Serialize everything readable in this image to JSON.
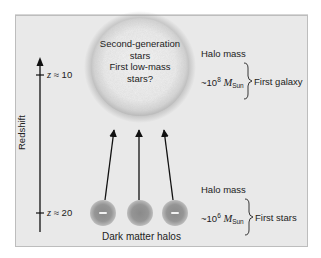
{
  "diagram": {
    "axis": {
      "label": "Redshift",
      "ticks": [
        {
          "symbol": "z",
          "approx": "≈",
          "value": "10"
        },
        {
          "symbol": "z",
          "approx": "≈",
          "value": "20"
        }
      ]
    },
    "sphere": {
      "lines": [
        "Second-generation",
        "stars",
        "First low-mass",
        "stars?"
      ]
    },
    "halos": {
      "label": "Dark matter halos",
      "count": 3
    },
    "upper": {
      "heading": "Halo mass",
      "prefix": "~10",
      "exponent": "8",
      "unit_symbol": "M",
      "unit_sub": "Sun",
      "result": "First galaxy"
    },
    "lower": {
      "heading": "Halo mass",
      "prefix": "~10",
      "exponent": "6",
      "unit_symbol": "M",
      "unit_sub": "Sun",
      "result": "First stars"
    },
    "colors": {
      "background": "#e9e9e9",
      "border": "#bdbdbd",
      "sphere_light": "#f3f3f3",
      "sphere_edge": "#bcbcbc",
      "halo_center": "#8a8a8a",
      "halo_edge": "#b5b5b5",
      "arrow": "#111111"
    }
  }
}
